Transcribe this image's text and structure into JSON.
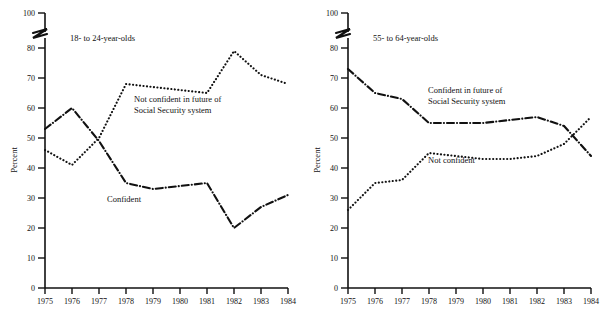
{
  "figure": {
    "width": 606,
    "height": 323,
    "background": "#ffffff",
    "ink_color": "#111111"
  },
  "chart_data": [
    {
      "type": "line",
      "title": "18- to 24-year-olds",
      "xlabel": "",
      "ylabel": "Percent",
      "x": [
        1975,
        1976,
        1977,
        1978,
        1979,
        1980,
        1981,
        1982,
        1983,
        1984
      ],
      "xlim": [
        1975,
        1984
      ],
      "ylim": [
        0,
        100
      ],
      "yticks": [
        0,
        10,
        20,
        30,
        40,
        50,
        60,
        70,
        80,
        100
      ],
      "ytick_labels": [
        "0",
        "10",
        "20",
        "30",
        "40",
        "50",
        "60",
        "70",
        "80",
        "100"
      ],
      "xtick_labels": [
        "1975",
        "1976",
        "1977",
        "1978",
        "1979",
        "1980",
        "1981",
        "1982",
        "1983",
        "1984"
      ],
      "axis_break": {
        "between": [
          80,
          100
        ],
        "present": true
      },
      "grid": false,
      "legend": "inline-annotations",
      "series": [
        {
          "name": "Not confident in future of Social Security system",
          "label_lines": [
            "Not confident in future of",
            "Social Security system"
          ],
          "style": "dotted",
          "values": [
            46,
            41,
            50,
            68,
            67,
            66,
            65,
            79,
            71,
            68
          ]
        },
        {
          "name": "Confident",
          "label_lines": [
            "Confident"
          ],
          "style": "dash-dot",
          "values": [
            53,
            60,
            49,
            35,
            33,
            34,
            35,
            20,
            27,
            31
          ]
        }
      ]
    },
    {
      "type": "line",
      "title": "55- to 64-year-olds",
      "xlabel": "",
      "ylabel": "Percent",
      "x": [
        1975,
        1976,
        1977,
        1978,
        1979,
        1980,
        1981,
        1982,
        1983,
        1984
      ],
      "xlim": [
        1975,
        1984
      ],
      "ylim": [
        0,
        100
      ],
      "yticks": [
        0,
        10,
        20,
        30,
        40,
        50,
        60,
        70,
        80,
        100
      ],
      "ytick_labels": [
        "0",
        "10",
        "20",
        "30",
        "40",
        "50",
        "60",
        "70",
        "80",
        "100"
      ],
      "xtick_labels": [
        "1975",
        "1976",
        "1977",
        "1978",
        "1979",
        "1980",
        "1981",
        "1982",
        "1983",
        "1984"
      ],
      "axis_break": {
        "between": [
          80,
          100
        ],
        "present": true
      },
      "grid": false,
      "legend": "inline-annotations",
      "series": [
        {
          "name": "Confident in future of Social Security system",
          "label_lines": [
            "Confident in future of",
            "Social Security system"
          ],
          "style": "dash-dot",
          "values": [
            73,
            65,
            63,
            55,
            55,
            55,
            56,
            57,
            54,
            44
          ]
        },
        {
          "name": "Not confident",
          "label_lines": [
            "Not confident"
          ],
          "style": "dotted",
          "values": [
            26,
            35,
            36,
            45,
            44,
            43,
            43,
            44,
            48,
            57
          ]
        }
      ]
    }
  ],
  "panels": [
    {
      "title": "18- to 24-year-olds",
      "y_axis_title": "Percent",
      "series_labels": [
        {
          "lines": [
            "Not confident in future of",
            "Social Security system"
          ]
        },
        {
          "lines": [
            "Confident"
          ]
        }
      ]
    },
    {
      "title": "55- to 64-year-olds",
      "y_axis_title": "Percent",
      "series_labels": [
        {
          "lines": [
            "Confident in future of",
            "Social Security system"
          ]
        },
        {
          "lines": [
            "Not confident"
          ]
        }
      ]
    }
  ]
}
